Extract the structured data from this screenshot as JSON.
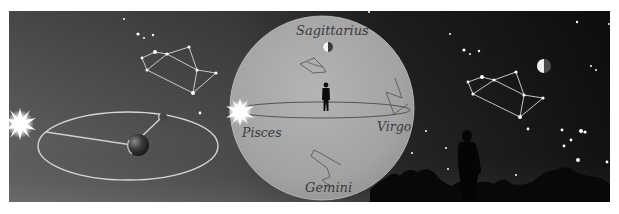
{
  "figure": {
    "colors": {
      "background_left": "#5a5a5a",
      "background_right": "#141414",
      "sphere_fill": "#a9a9a9",
      "sphere_edge": "#bdbdbd",
      "orbit_line": "#d8d8d8",
      "star": "#ffffff",
      "silhouette": "#0a0a0a",
      "label_text": "#3a3a3a"
    }
  },
  "sphere": {
    "labels": {
      "top": "Sagittarius",
      "left": "Pisces",
      "right": "Virgo",
      "bottom": "Gemini"
    }
  },
  "icons": {
    "sun_left": "sun-icon",
    "sun_sphere": "sun-icon",
    "earth": "earth-icon",
    "moon_orbit": "moon-icon",
    "moon_sphere": "half-moon-icon",
    "moon_sky": "half-moon-icon",
    "observer_sphere": "person-silhouette-icon",
    "observer_sky": "person-silhouette-icon"
  }
}
